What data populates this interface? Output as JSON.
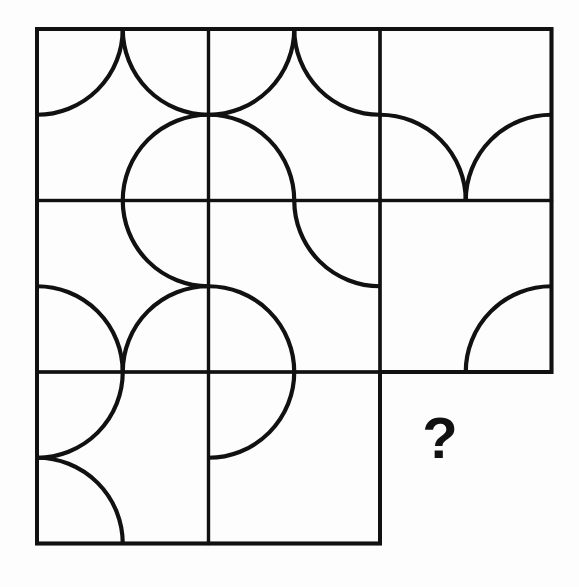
{
  "puzzle": {
    "title": "Matrix Reasoning Puzzle",
    "type": "progressive-matrix",
    "description": "3 by 3 grid of square tiles, each tile decorated with quarter-circle arcs at some of its corners. The bottom-right tile is missing and marked with a question mark.",
    "missing_cell_marker": "?",
    "background_color": "#fdfdfd",
    "line_color": "#111111"
  },
  "geometry": {
    "origin_x": 37,
    "origin_y": 29,
    "cell_size": 171.5,
    "rows": 3,
    "cols": 3,
    "border_width": 4,
    "inner_line_width": 3.2,
    "arc_radius": 85.75,
    "arc_width": 4.2
  },
  "cells": [
    {
      "row": 0,
      "col": 0,
      "name": "cell-r1c1",
      "has_box": true,
      "arc_count": 3,
      "arcs": [
        "top-left",
        "top-right",
        "bottom-right"
      ]
    },
    {
      "row": 0,
      "col": 1,
      "name": "cell-r1c2",
      "has_box": true,
      "arc_count": 3,
      "arcs": [
        "top-left",
        "top-right",
        "bottom-left"
      ]
    },
    {
      "row": 0,
      "col": 2,
      "name": "cell-r1c3",
      "has_box": true,
      "arc_count": 2,
      "arcs": [
        "bottom-left",
        "bottom-right"
      ]
    },
    {
      "row": 1,
      "col": 0,
      "name": "cell-r2c1",
      "has_box": true,
      "arc_count": 3,
      "arcs": [
        "top-right",
        "bottom-left",
        "bottom-right"
      ]
    },
    {
      "row": 1,
      "col": 1,
      "name": "cell-r2c2",
      "has_box": true,
      "arc_count": 2,
      "arcs": [
        "top-right",
        "bottom-left"
      ]
    },
    {
      "row": 1,
      "col": 2,
      "name": "cell-r2c3",
      "has_box": true,
      "arc_count": 1,
      "arcs": [
        "bottom-right"
      ]
    },
    {
      "row": 2,
      "col": 0,
      "name": "cell-r3c1",
      "has_box": true,
      "arc_count": 2,
      "arcs": [
        "top-left",
        "bottom-left"
      ]
    },
    {
      "row": 2,
      "col": 1,
      "name": "cell-r3c2",
      "has_box": true,
      "arc_count": 1,
      "arcs": [
        "top-left"
      ]
    },
    {
      "row": 2,
      "col": 2,
      "name": "cell-r3c3-missing",
      "has_box": false,
      "arc_count": 0,
      "arcs": [],
      "marker": "?"
    }
  ],
  "question_mark": {
    "label": "?",
    "x": 440,
    "y": 443,
    "font_size": 58
  }
}
